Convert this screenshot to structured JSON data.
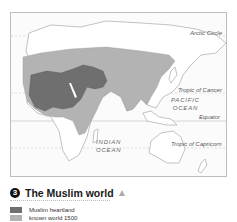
{
  "map": {
    "labels": {
      "arctic_circle": "Arctic Circle",
      "tropic_of_cancer": "Tropic of Cancer",
      "equator": "Equator",
      "tropic_of_capricorn": "Tropic of Capricorn",
      "pacific_ocean_line1": "PACIFIC",
      "pacific_ocean_line2": "OCEAN",
      "indian_ocean_line1": "INDIAN",
      "indian_ocean_line2": "OCEAN"
    },
    "colors": {
      "muslim_heartland": "#6f6f6f",
      "known_world_1500": "#b3b3b3",
      "land": "#ffffff",
      "outline": "#9a9a9a"
    }
  },
  "caption": {
    "number": "3",
    "title": "The Muslim world",
    "marker_icon": "triangle-up-icon"
  },
  "legend": {
    "items": [
      {
        "label": "Muslim heartland",
        "color": "#6f6f6f"
      },
      {
        "label": "known world 1500",
        "color": "#b3b3b3"
      }
    ]
  }
}
